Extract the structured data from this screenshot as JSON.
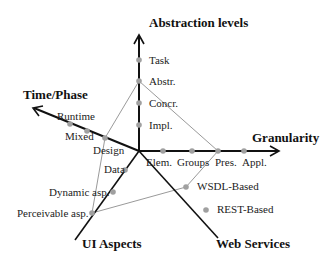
{
  "axes": {
    "abstraction": {
      "title": "Abstraction levels",
      "ticks": [
        "Task",
        "Abstr.",
        "Concr.",
        "Impl."
      ]
    },
    "granularity": {
      "title": "Granularity",
      "ticks": [
        "Elem.",
        "Groups",
        "Pres.",
        "Appl."
      ]
    },
    "time_phase": {
      "title": "Time/Phase",
      "ticks": [
        "Runtime",
        "Mixed",
        "Design"
      ]
    },
    "ui_aspects": {
      "title": "UI Aspects",
      "ticks": [
        "Data",
        "Dynamic  asp.",
        "Perceivable  asp."
      ]
    },
    "web_services": {
      "title": "Web Services",
      "ticks": [
        "WSDL-Based",
        "REST-Based"
      ]
    }
  },
  "profile": {
    "points": [
      "Abstr.",
      "Pres.",
      "WSDL-Based",
      "Perceivable asp.",
      "Design"
    ],
    "color": "#9a9a9a"
  },
  "colors": {
    "axis": "#111111",
    "dot": "#a0a0a0"
  }
}
